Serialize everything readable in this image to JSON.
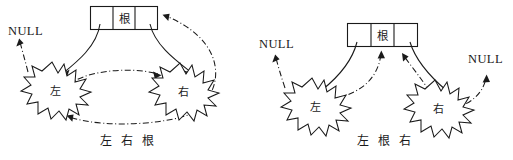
{
  "figure": {
    "background_color": "#ffffff",
    "line_color": "#1a1a1a",
    "width": 513,
    "height": 160
  },
  "diagrams": [
    {
      "id": "postorder",
      "caption": "左 右 根",
      "node": {
        "label": "根",
        "cells": [
          "",
          "根",
          ""
        ]
      },
      "children": [
        {
          "id": "left",
          "label": "左"
        },
        {
          "id": "right",
          "label": "右"
        }
      ],
      "null_labels": [
        {
          "id": "null-left",
          "text": "NULL"
        }
      ],
      "solid_edges": [
        {
          "from": "root-left-cell",
          "to": "left-star"
        },
        {
          "from": "root-right-cell",
          "to": "right-star"
        }
      ],
      "traversal_edges": [
        {
          "from": "null-source",
          "to": "null-left"
        },
        {
          "from": "left-star",
          "to": "right-star"
        },
        {
          "from": "right-star",
          "to": "root-right-cell"
        },
        {
          "from": "right-region",
          "to": "left-star"
        }
      ]
    },
    {
      "id": "inorder",
      "caption": "左 根 右",
      "node": {
        "label": "根",
        "cells": [
          "",
          "根",
          ""
        ]
      },
      "children": [
        {
          "id": "left",
          "label": "左"
        },
        {
          "id": "right",
          "label": "右"
        }
      ],
      "null_labels": [
        {
          "id": "null-left",
          "text": "NULL"
        },
        {
          "id": "null-right",
          "text": "NULL"
        }
      ],
      "solid_edges": [
        {
          "from": "root-left-cell",
          "to": "left-star"
        },
        {
          "from": "root-right-cell",
          "to": "right-star"
        }
      ],
      "traversal_edges": [
        {
          "from": "null-source",
          "to": "null-left"
        },
        {
          "from": "left-star",
          "to": "root-middle-cell"
        },
        {
          "from": "right-star",
          "to": "root-right-cell"
        },
        {
          "from": "right-star",
          "to": "null-right"
        }
      ]
    }
  ]
}
